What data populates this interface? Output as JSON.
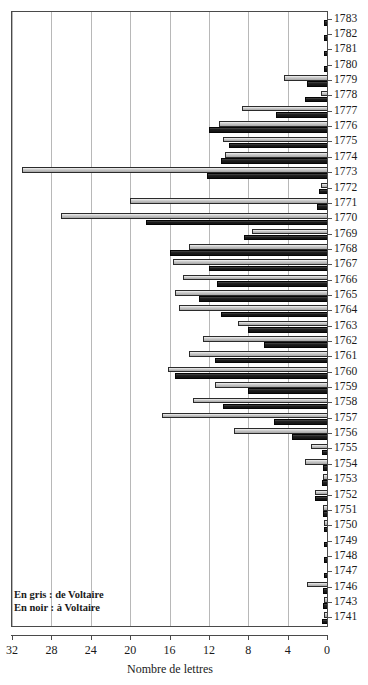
{
  "chart_data": {
    "type": "bar",
    "orientation": "horizontal-right-to-left",
    "title": "",
    "xlabel": "Nombre de lettres",
    "ylabel": "",
    "xlim": [
      32,
      0
    ],
    "xticks": [
      32,
      28,
      24,
      20,
      16,
      12,
      8,
      4,
      0
    ],
    "grid": true,
    "legend_position": "bottom-left",
    "legend": [
      {
        "key": "grey",
        "label": "En gris : de Voltaire",
        "color": "#b5b5b5"
      },
      {
        "key": "black",
        "label": "En noir : à Voltaire",
        "color": "#232323"
      }
    ],
    "series": [
      {
        "name": "de Voltaire",
        "key": "grey",
        "color": "#b5b5b5"
      },
      {
        "name": "à Voltaire",
        "key": "black",
        "color": "#232323"
      }
    ],
    "categories": [
      "1783",
      "1782",
      "1781",
      "1780",
      "1779",
      "1778",
      "1777",
      "1776",
      "1775",
      "1774",
      "1773",
      "1772",
      "1771",
      "1770",
      "1769",
      "1768",
      "1767",
      "1766",
      "1765",
      "1764",
      "1763",
      "1762",
      "1761",
      "1760",
      "1759",
      "1758",
      "1757",
      "1756",
      "1755",
      "1754",
      "1753",
      "1752",
      "1751",
      "1750",
      "1749",
      "1748",
      "1747",
      "1746",
      "1743",
      "1741"
    ],
    "values_grey": [
      0,
      0,
      0,
      0,
      4.4,
      0.6,
      8.6,
      11.0,
      10.6,
      10.4,
      31.0,
      0.6,
      20.0,
      27.0,
      7.6,
      14.0,
      15.6,
      14.6,
      15.4,
      15.0,
      9.0,
      12.6,
      14.0,
      16.2,
      11.4,
      13.6,
      16.8,
      9.4,
      1.6,
      2.2,
      0.4,
      1.2,
      0.4,
      0.3,
      0,
      0,
      0,
      2.0,
      0.3,
      0.3
    ],
    "values_black": [
      0.3,
      0.3,
      0.3,
      0.3,
      2.0,
      2.2,
      5.2,
      12.0,
      10.0,
      10.8,
      12.2,
      0.8,
      1.0,
      18.4,
      8.4,
      16.0,
      12.0,
      11.2,
      13.0,
      10.8,
      8.0,
      6.4,
      11.4,
      15.4,
      8.0,
      10.6,
      5.4,
      3.6,
      0.5,
      0.4,
      0.5,
      1.2,
      0.4,
      0.3,
      0.3,
      0.3,
      0.3,
      0.4,
      0.4,
      0.5
    ]
  }
}
